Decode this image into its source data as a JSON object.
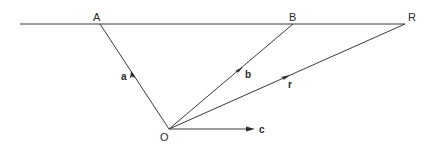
{
  "diagram": {
    "points": {
      "A": {
        "label": "A",
        "x": 100,
        "y": 24
      },
      "B": {
        "label": "B",
        "x": 293,
        "y": 24
      },
      "R": {
        "label": "R",
        "x": 405,
        "y": 24
      },
      "O": {
        "label": "O",
        "x": 169,
        "y": 129
      }
    },
    "vectors": {
      "a": {
        "label": "a"
      },
      "b": {
        "label": "b"
      },
      "r": {
        "label": "r"
      },
      "c": {
        "label": "c"
      }
    },
    "colors": {
      "line": "#3a3a3a",
      "text": "#2a2a2a",
      "background": "#ffffff"
    }
  }
}
